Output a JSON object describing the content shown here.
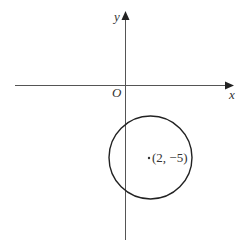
{
  "diagram": {
    "type": "coordinate-plane-circle",
    "axes": {
      "x_label": "x",
      "y_label": "y",
      "origin_label": "O"
    },
    "circle": {
      "center_label": "(2, −5)",
      "center": [
        2,
        -5
      ]
    },
    "colors": {
      "axis": "#555555",
      "circle": "#222222",
      "text": "#333333",
      "background": "#ffffff"
    }
  }
}
